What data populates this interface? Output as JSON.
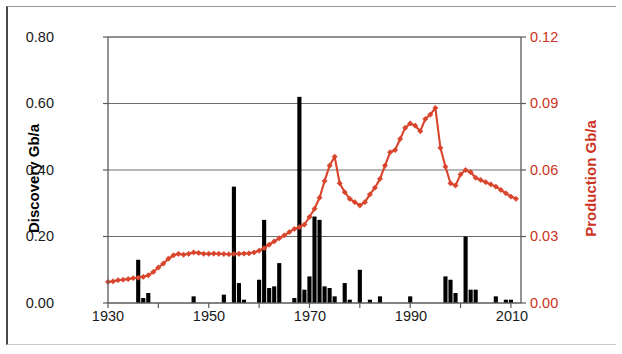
{
  "chart_data": {
    "type": "bar",
    "title": "",
    "subtitle": "",
    "xlabel": "",
    "ylabel": "Discovery Gb/a",
    "y2label": "Production Gb/a",
    "xlim": [
      1930,
      2012
    ],
    "ylim": [
      0.0,
      0.8
    ],
    "y2lim": [
      0.0,
      0.12
    ],
    "grid": true,
    "legend": "none",
    "x_tick_labels": [
      "1930",
      "1950",
      "1970",
      "1990",
      "2010"
    ],
    "x_tick_values": [
      1930,
      1950,
      1970,
      1990,
      2010
    ],
    "x_minor_tick_values": [
      1940,
      1960,
      1980,
      2000
    ],
    "y_tick_labels": [
      "0.00",
      "0.20",
      "0.40",
      "0.60",
      "0.80"
    ],
    "y_tick_values": [
      0.0,
      0.2,
      0.4,
      0.6,
      0.8
    ],
    "y2_tick_labels": [
      "0.00",
      "0.03",
      "0.06",
      "0.09",
      "0.12"
    ],
    "y2_tick_values": [
      0.0,
      0.03,
      0.06,
      0.09,
      0.12
    ],
    "series": [
      {
        "name": "Discovery",
        "type": "bar",
        "axis": "left",
        "unit": "Gb/a",
        "color": "#000000",
        "x": [
          1930,
          1931,
          1932,
          1933,
          1934,
          1935,
          1936,
          1937,
          1938,
          1939,
          1940,
          1941,
          1942,
          1943,
          1944,
          1945,
          1946,
          1947,
          1948,
          1949,
          1950,
          1951,
          1952,
          1953,
          1954,
          1955,
          1956,
          1957,
          1958,
          1959,
          1960,
          1961,
          1962,
          1963,
          1964,
          1965,
          1966,
          1967,
          1968,
          1969,
          1970,
          1971,
          1972,
          1973,
          1974,
          1975,
          1976,
          1977,
          1978,
          1979,
          1980,
          1981,
          1982,
          1983,
          1984,
          1985,
          1986,
          1987,
          1988,
          1989,
          1990,
          1991,
          1992,
          1993,
          1994,
          1995,
          1996,
          1997,
          1998,
          1999,
          2000,
          2001,
          2002,
          2003,
          2004,
          2005,
          2006,
          2007,
          2008,
          2009,
          2010,
          2011
        ],
        "values": [
          0.0,
          0.0,
          0.0,
          0.0,
          0.0,
          0.0,
          0.13,
          0.015,
          0.03,
          0.0,
          0.0,
          0.0,
          0.0,
          0.0,
          0.0,
          0.0,
          0.0,
          0.02,
          0.0,
          0.0,
          0.0,
          0.0,
          0.0,
          0.025,
          0.0,
          0.35,
          0.06,
          0.01,
          0.0,
          0.0,
          0.07,
          0.25,
          0.045,
          0.05,
          0.12,
          0.0,
          0.0,
          0.015,
          0.62,
          0.04,
          0.08,
          0.26,
          0.25,
          0.05,
          0.045,
          0.02,
          0.0,
          0.06,
          0.01,
          0.0,
          0.1,
          0.0,
          0.01,
          0.0,
          0.02,
          0.0,
          0.0,
          0.0,
          0.0,
          0.0,
          0.02,
          0.0,
          0.0,
          0.0,
          0.0,
          0.0,
          0.0,
          0.08,
          0.07,
          0.03,
          0.0,
          0.2,
          0.04,
          0.04,
          0.0,
          0.0,
          0.0,
          0.02,
          0.0,
          0.01,
          0.01,
          0.0
        ]
      },
      {
        "name": "Production",
        "type": "line",
        "axis": "right",
        "unit": "Gb/a",
        "color": "#d9452c",
        "marker": "diamond",
        "x": [
          1930,
          1931,
          1932,
          1933,
          1934,
          1935,
          1936,
          1937,
          1938,
          1939,
          1940,
          1941,
          1942,
          1943,
          1944,
          1945,
          1946,
          1947,
          1948,
          1949,
          1950,
          1951,
          1952,
          1953,
          1954,
          1955,
          1956,
          1957,
          1958,
          1959,
          1960,
          1961,
          1962,
          1963,
          1964,
          1965,
          1966,
          1967,
          1968,
          1969,
          1970,
          1971,
          1972,
          1973,
          1974,
          1975,
          1976,
          1977,
          1978,
          1979,
          1980,
          1981,
          1982,
          1983,
          1984,
          1985,
          1986,
          1987,
          1988,
          1989,
          1990,
          1991,
          1992,
          1993,
          1994,
          1995,
          1996,
          1997,
          1998,
          1999,
          2000,
          2001,
          2002,
          2003,
          2004,
          2005,
          2006,
          2007,
          2008,
          2009,
          2010,
          2011
        ],
        "values": [
          0.0095,
          0.0098,
          0.0103,
          0.0105,
          0.0108,
          0.0112,
          0.0114,
          0.0118,
          0.0125,
          0.014,
          0.016,
          0.0178,
          0.02,
          0.0215,
          0.0222,
          0.0218,
          0.0222,
          0.0228,
          0.0226,
          0.0222,
          0.0222,
          0.0223,
          0.0222,
          0.0221,
          0.022,
          0.0221,
          0.0222,
          0.0223,
          0.0224,
          0.0228,
          0.0236,
          0.0248,
          0.0263,
          0.0278,
          0.0292,
          0.0305,
          0.032,
          0.0334,
          0.0342,
          0.0354,
          0.0388,
          0.0425,
          0.0475,
          0.055,
          0.062,
          0.066,
          0.054,
          0.05,
          0.047,
          0.0455,
          0.044,
          0.0455,
          0.049,
          0.052,
          0.056,
          0.062,
          0.068,
          0.069,
          0.074,
          0.079,
          0.081,
          0.08,
          0.0775,
          0.083,
          0.085,
          0.088,
          0.07,
          0.0615,
          0.054,
          0.053,
          0.058,
          0.06,
          0.059,
          0.0565,
          0.0555,
          0.0545,
          0.0535,
          0.0525,
          0.051,
          0.0495,
          0.048,
          0.047
        ]
      }
    ]
  },
  "axes": {
    "left": {
      "title": "Discovery Gb/a",
      "color": "#000000",
      "ticks": [
        "0.00",
        "0.20",
        "0.40",
        "0.60",
        "0.80"
      ]
    },
    "right": {
      "title": "Production Gb/a",
      "color": "#cc3322",
      "ticks": [
        "0.00",
        "0.03",
        "0.06",
        "0.09",
        "0.12"
      ]
    },
    "bottom": {
      "ticks": [
        "1930",
        "1950",
        "1970",
        "1990",
        "2010"
      ]
    }
  }
}
